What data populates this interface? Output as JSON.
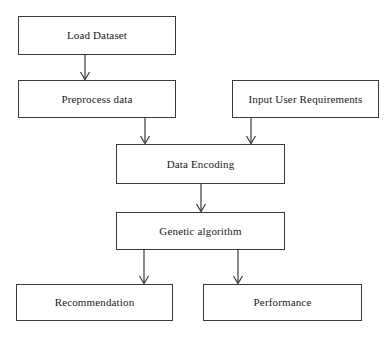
{
  "diagram": {
    "type": "flowchart",
    "background_color": "#ffffff",
    "stroke_color": "#3a3a3a",
    "text_color": "#1a1a1a",
    "nodes": [
      {
        "id": "load-dataset",
        "label": "Load Dataset"
      },
      {
        "id": "preprocess-data",
        "label": "Preprocess data"
      },
      {
        "id": "input-user-req",
        "label": "Input User Requirements"
      },
      {
        "id": "data-encoding",
        "label": "Data Encoding"
      },
      {
        "id": "genetic-algorithm",
        "label": "Genetic algorithm"
      },
      {
        "id": "recommendation",
        "label": "Recommendation"
      },
      {
        "id": "performance",
        "label": "Performance"
      }
    ],
    "edges": [
      {
        "from": "load-dataset",
        "to": "preprocess-data"
      },
      {
        "from": "preprocess-data",
        "to": "data-encoding"
      },
      {
        "from": "input-user-req",
        "to": "data-encoding"
      },
      {
        "from": "data-encoding",
        "to": "genetic-algorithm"
      },
      {
        "from": "genetic-algorithm",
        "to": "recommendation"
      },
      {
        "from": "genetic-algorithm",
        "to": "performance"
      }
    ]
  }
}
